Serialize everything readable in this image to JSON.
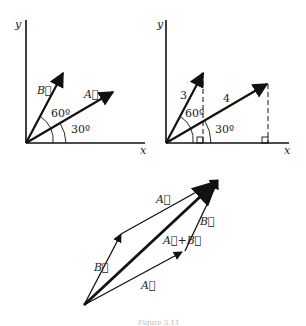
{
  "diagram": {
    "panel_left": {
      "axis_x": "x",
      "axis_y": "y",
      "vector_a": "A⃗",
      "vector_b": "B⃗",
      "angle_a": "30º",
      "angle_b": "60º"
    },
    "panel_right": {
      "axis_x": "x",
      "axis_y": "y",
      "length_b": "3",
      "length_a": "4",
      "angle_a": "30º",
      "angle_b": "60º"
    },
    "panel_bottom": {
      "vector_a_top": "A⃗",
      "vector_a_bottom": "A⃗",
      "vector_b_left": "B⃗",
      "vector_b_right": "B⃗",
      "resultant": "A⃗+B⃗"
    },
    "caption": "Figure 3.11"
  }
}
